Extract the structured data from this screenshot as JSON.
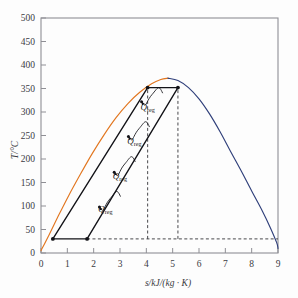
{
  "figure": {
    "name": "temperature-entropy-diagram",
    "background": "#fdfdfd"
  },
  "axes": {
    "y": {
      "label": "T/°C",
      "unit": "°C",
      "min": 0,
      "max": 500,
      "ticks": [
        0,
        50,
        100,
        150,
        200,
        250,
        300,
        350,
        400,
        450,
        500
      ],
      "tick_labels": [
        "0",
        "50",
        "100",
        "150",
        "200",
        "250",
        "300",
        "350",
        "400",
        "450",
        "500"
      ]
    },
    "x": {
      "label": "s/kJ/(kg · K)",
      "unit": "kJ/(kg·K)",
      "min": 0,
      "max": 9,
      "ticks": [
        0,
        1,
        2,
        3,
        4,
        5,
        6,
        7,
        8,
        9
      ],
      "tick_labels": [
        "0",
        "1",
        "2",
        "3",
        "4",
        "5",
        "6",
        "7",
        "8",
        "9"
      ]
    },
    "frame_color": "#8f8f95",
    "grid": false
  },
  "colors": {
    "saturated_liquid": "#e2761f",
    "saturated_vapour": "#2f3f7a",
    "cycle": "#121217",
    "dashed": "#333338",
    "text": "#3b3b42"
  },
  "annotations": {
    "regeneration_labels": [
      {
        "text": "Q",
        "sub": "reg",
        "x": 4.05,
        "y": 305
      },
      {
        "text": "Q",
        "sub": "reg",
        "x": 3.55,
        "y": 232
      },
      {
        "text": "Q",
        "sub": "reg",
        "x": 3.0,
        "y": 158
      },
      {
        "text": "Q",
        "sub": "reg",
        "x": 2.45,
        "y": 88
      }
    ]
  },
  "chart_data": {
    "type": "line",
    "title": "",
    "xlabel": "s/kJ/(kg · K)",
    "ylabel": "T/°C",
    "xlim": [
      0,
      9
    ],
    "ylim": [
      0,
      500
    ],
    "grid": false,
    "legend": "none",
    "series": [
      {
        "name": "saturated-liquid-line",
        "color": "#e2761f",
        "points": [
          [
            0.0,
            5
          ],
          [
            0.3,
            38
          ],
          [
            0.65,
            78
          ],
          [
            1.05,
            122
          ],
          [
            1.5,
            168
          ],
          [
            1.95,
            212
          ],
          [
            2.4,
            252
          ],
          [
            2.85,
            288
          ],
          [
            3.3,
            318
          ],
          [
            3.75,
            342
          ],
          [
            4.2,
            360
          ],
          [
            4.55,
            369
          ],
          [
            4.82,
            372
          ]
        ]
      },
      {
        "name": "saturated-vapour-line",
        "color": "#2f3f7a",
        "points": [
          [
            4.82,
            372
          ],
          [
            5.2,
            367
          ],
          [
            5.6,
            352
          ],
          [
            6.0,
            328
          ],
          [
            6.4,
            296
          ],
          [
            6.8,
            258
          ],
          [
            7.2,
            216
          ],
          [
            7.6,
            175
          ],
          [
            8.0,
            132
          ],
          [
            8.4,
            90
          ],
          [
            8.7,
            55
          ],
          [
            8.95,
            22
          ],
          [
            9.0,
            10
          ]
        ]
      },
      {
        "name": "cycle-compression-left-branch",
        "color": "#121217",
        "points": [
          [
            0.45,
            30
          ],
          [
            4.05,
            352
          ]
        ]
      },
      {
        "name": "cycle-expansion-right-branch",
        "color": "#121217",
        "points": [
          [
            1.75,
            30
          ],
          [
            5.2,
            352
          ]
        ]
      },
      {
        "name": "cycle-heat-addition-top",
        "color": "#121217",
        "points": [
          [
            4.05,
            352
          ],
          [
            5.2,
            352
          ]
        ]
      },
      {
        "name": "cycle-heat-rejection-bottom",
        "color": "#121217",
        "points": [
          [
            0.45,
            30
          ],
          [
            1.75,
            30
          ]
        ]
      }
    ],
    "dashed_guides": [
      {
        "name": "vertical-guide-state-4",
        "x": 4.05,
        "y0": 30,
        "y1": 352
      },
      {
        "name": "vertical-guide-state-3",
        "x": 5.2,
        "y0": 30,
        "y1": 352
      },
      {
        "name": "horizontal-guide-bottom",
        "y": 30,
        "x0": 1.75,
        "x1": 9.0
      }
    ],
    "state_points": [
      {
        "name": "state-point-bottom-left",
        "x": 0.45,
        "y": 30
      },
      {
        "name": "state-point-bottom-right",
        "x": 1.75,
        "y": 30
      },
      {
        "name": "state-point-top-left",
        "x": 4.05,
        "y": 352
      },
      {
        "name": "state-point-top-right",
        "x": 5.2,
        "y": 352
      }
    ],
    "regeneration_arrows": [
      {
        "name": "regeneration-arrow-1",
        "from": [
          4.62,
          340
        ],
        "to": [
          3.82,
          322
        ]
      },
      {
        "name": "regeneration-arrow-2",
        "from": [
          4.12,
          268
        ],
        "to": [
          3.32,
          248
        ]
      },
      {
        "name": "regeneration-arrow-3",
        "from": [
          3.58,
          194
        ],
        "to": [
          2.78,
          172
        ]
      },
      {
        "name": "regeneration-arrow-4",
        "from": [
          3.02,
          120
        ],
        "to": [
          2.22,
          98
        ]
      }
    ]
  }
}
